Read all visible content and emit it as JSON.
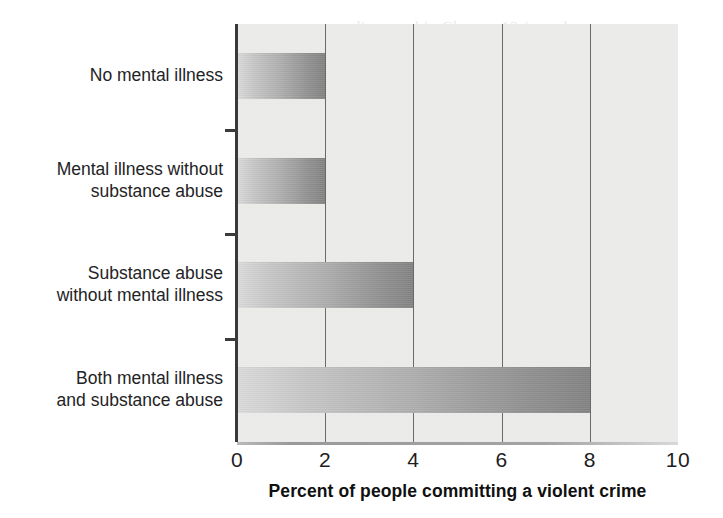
{
  "scan": {
    "ghost_lines": [
      {
        "text": "discussed in Chapter 12 (see also",
        "x": 352,
        "y": 18
      },
      {
        "text": "not be able to smoke, that",
        "x": 355,
        "y": 55
      },
      {
        "text": "in the psychiatric field, 2014",
        "x": 352,
        "y": 82
      },
      {
        "text": "they are abusers of one substance",
        "x": 350,
        "y": 112
      },
      {
        "text": "alone may even triple the risk",
        "x": 352,
        "y": 142
      },
      {
        "text": "Pierce, 2003). Take back the law",
        "x": 350,
        "y": 172
      },
      {
        "text": "of history, structure for people with the",
        "x": 349,
        "y": 200
      },
      {
        "text": "account identity that legal",
        "x": 352,
        "y": 230
      },
      {
        "text": "of the very nature in which",
        "x": 352,
        "y": 258
      },
      {
        "text": "Maguire & Carter, 2010). More serious when",
        "x": 348,
        "y": 288
      },
      {
        "text": "a difference that may have",
        "x": 350,
        "y": 318
      },
      {
        "text": "and 5.7% of people who have",
        "x": 351,
        "y": 346
      },
      {
        "text": "is not just about the mental illness",
        "x": 350,
        "y": 374
      }
    ]
  },
  "chart_data": {
    "type": "bar",
    "orientation": "horizontal",
    "title": "",
    "xlabel": "Percent of people committing a violent crime",
    "ylabel": "",
    "categories": [
      "No mental illness",
      "Mental illness without\nsubstance abuse",
      "Substance abuse\nwithout mental illness",
      "Both mental illness\nand substance abuse"
    ],
    "values": [
      2,
      2,
      4,
      8
    ],
    "xlim": [
      0,
      10
    ],
    "xticks": [
      0,
      2,
      4,
      6,
      8,
      10
    ],
    "xtick_labels": [
      "0",
      "2",
      "4",
      "6",
      "8",
      "10"
    ],
    "grid": "vertical",
    "legend": "none",
    "bar_gradient_start": "#dcdcdc",
    "bar_gradient_end": "#858586",
    "plot_background": "#ececeb",
    "axis_color": "#39393a",
    "gridline_color": "#6a6a6a"
  }
}
